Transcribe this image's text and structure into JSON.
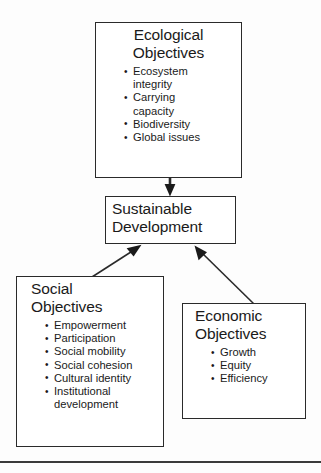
{
  "diagram": {
    "background_color": "#fdfdfd",
    "line_color": "#2a2a2a",
    "boxes": {
      "ecological": {
        "title_line1": "Ecological",
        "title_line2": "Objectives",
        "bullets": [
          "Ecosystem",
          "integrity",
          "Carrying",
          "capacity",
          "Biodiversity",
          "Global issues"
        ],
        "bullet_items": [
          {
            "line1": "Ecosystem",
            "line2": "integrity"
          },
          {
            "line1": "Carrying",
            "line2": "capacity"
          },
          {
            "line1": "Biodiversity",
            "line2": ""
          },
          {
            "line1": "Global issues",
            "line2": ""
          }
        ]
      },
      "sustainable": {
        "title_line1": "Sustainable",
        "title_line2": "Development"
      },
      "social": {
        "title_line1": "Social",
        "title_line2": "Objectives",
        "bullet_items": [
          {
            "line1": "Empowerment",
            "line2": ""
          },
          {
            "line1": "Participation",
            "line2": ""
          },
          {
            "line1": "Social mobility",
            "line2": ""
          },
          {
            "line1": "Social cohesion",
            "line2": ""
          },
          {
            "line1": "Cultural identity",
            "line2": ""
          },
          {
            "line1": "Institutional",
            "line2": "development"
          }
        ]
      },
      "economic": {
        "title_line1": "Economic",
        "title_line2": "Objectives",
        "bullet_items": [
          {
            "line1": "Growth",
            "line2": ""
          },
          {
            "line1": "Equity",
            "line2": ""
          },
          {
            "line1": "Efficiency",
            "line2": ""
          }
        ]
      }
    },
    "arrows": [
      {
        "name": "ecological-to-sustainable",
        "from": "ecological",
        "to": "sustainable",
        "direction": "down"
      },
      {
        "name": "social-to-sustainable",
        "from": "social",
        "to": "sustainable",
        "direction": "up-right"
      },
      {
        "name": "economic-to-sustainable",
        "from": "economic",
        "to": "sustainable",
        "direction": "up-left"
      }
    ],
    "footer_rule": true
  }
}
